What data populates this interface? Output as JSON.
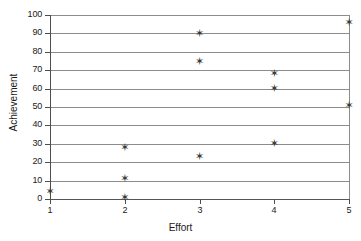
{
  "chart_data": {
    "type": "scatter",
    "title": "",
    "xlabel": "Effort",
    "ylabel": "Achievement",
    "xlim": [
      1,
      5
    ],
    "ylim": [
      0,
      100
    ],
    "grid": true,
    "legend": false,
    "marker": "star",
    "marker_color": "#3a3a3a",
    "xticks": [
      1,
      2,
      3,
      4,
      5
    ],
    "yticks": [
      0,
      10,
      20,
      30,
      40,
      50,
      60,
      70,
      80,
      90,
      100
    ],
    "x": [
      1,
      2,
      2,
      2,
      3,
      3,
      3,
      4,
      4,
      4,
      5,
      5
    ],
    "y": [
      4,
      1,
      11,
      28,
      23,
      75,
      90,
      30,
      60,
      68,
      51,
      96
    ],
    "points": [
      {
        "x": 1,
        "y": 4
      },
      {
        "x": 2,
        "y": 1
      },
      {
        "x": 2,
        "y": 11
      },
      {
        "x": 2,
        "y": 28
      },
      {
        "x": 3,
        "y": 23
      },
      {
        "x": 3,
        "y": 75
      },
      {
        "x": 3,
        "y": 90
      },
      {
        "x": 4,
        "y": 30
      },
      {
        "x": 4,
        "y": 60
      },
      {
        "x": 4,
        "y": 68
      },
      {
        "x": 5,
        "y": 51
      },
      {
        "x": 5,
        "y": 96
      }
    ]
  },
  "marker_glyph": "✶",
  "colors": {
    "gridline": "#8c8c8c",
    "axis": "#4d4d4d",
    "text": "#1a1a1a",
    "marker": "#3a3a3a",
    "background": "#ffffff"
  }
}
